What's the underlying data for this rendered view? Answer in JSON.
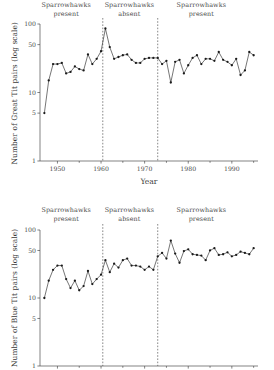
{
  "figure": {
    "background": "#ffffff",
    "ink": "#2b2b2b"
  },
  "chart_data": [
    {
      "type": "line",
      "id": "great-tit",
      "title": "",
      "xlabel": "Year",
      "ylabel": "Number of Great Tit pairs (log scale)",
      "xlim": [
        1946,
        1996
      ],
      "ylim": [
        1,
        100
      ],
      "yscale": "log",
      "grid": false,
      "legend_position": "none",
      "yticks": [
        1,
        5,
        10,
        50,
        100
      ],
      "ytick_labels": [
        "1",
        "5",
        "10",
        "50",
        "100"
      ],
      "xticks": [
        1950,
        1960,
        1970,
        1980,
        1990
      ],
      "xtick_labels": [
        "1950",
        "1960",
        "1970",
        "1980",
        "1990"
      ],
      "xticks_minor": [
        1945,
        1955,
        1965,
        1975,
        1985,
        1995
      ],
      "annotations": [
        {
          "text_line1": "Sparrowhawks",
          "text_line2": "present",
          "x": 1952
        },
        {
          "text_line1": "Sparrowhawks",
          "text_line2": "absent",
          "x": 1966.5
        },
        {
          "text_line1": "Sparrowhawks",
          "text_line2": "present",
          "x": 1983
        }
      ],
      "vlines": [
        1960.4,
        1973.0
      ],
      "x": [
        1947,
        1948,
        1949,
        1950,
        1951,
        1952,
        1953,
        1954,
        1955,
        1956,
        1957,
        1958,
        1959,
        1960,
        1961,
        1962,
        1963,
        1964,
        1965,
        1966,
        1967,
        1968,
        1969,
        1970,
        1971,
        1972,
        1973,
        1974,
        1975,
        1976,
        1977,
        1978,
        1979,
        1980,
        1981,
        1982,
        1983,
        1984,
        1985,
        1986,
        1987,
        1988,
        1989,
        1990,
        1991,
        1992,
        1993,
        1994,
        1995
      ],
      "values": [
        5,
        15,
        26,
        26,
        27,
        19,
        20,
        24,
        22,
        21,
        36,
        26,
        31,
        40,
        86,
        46,
        31,
        33,
        35,
        36,
        30,
        27,
        27,
        31,
        32,
        32,
        32,
        26,
        29,
        14,
        28,
        30,
        19,
        25,
        32,
        35,
        26,
        31,
        31,
        29,
        39,
        30,
        28,
        25,
        31,
        18,
        21,
        39,
        35
      ]
    },
    {
      "type": "line",
      "id": "blue-tit",
      "title": "",
      "xlabel": "",
      "ylabel": "Number of Blue Tit pairs (log scale)",
      "xlim": [
        1946,
        1996
      ],
      "ylim": [
        1,
        100
      ],
      "yscale": "log",
      "grid": false,
      "legend_position": "none",
      "yticks": [
        1,
        5,
        10,
        50,
        100
      ],
      "ytick_labels": [
        "1",
        "5",
        "10",
        "50",
        "100"
      ],
      "xticks": [
        1950,
        1960,
        1970,
        1980,
        1990
      ],
      "xtick_labels": [
        "",
        "",
        "",
        "",
        ""
      ],
      "xticks_minor": [
        1945,
        1955,
        1965,
        1975,
        1985,
        1995
      ],
      "annotations": [
        {
          "text_line1": "Sparrowhawks",
          "text_line2": "present",
          "x": 1952
        },
        {
          "text_line1": "Sparrowhawks",
          "text_line2": "absent",
          "x": 1966.5
        },
        {
          "text_line1": "Sparrowhawks",
          "text_line2": "present",
          "x": 1983
        }
      ],
      "vlines": [
        1960.4,
        1973.0
      ],
      "x": [
        1947,
        1948,
        1949,
        1950,
        1951,
        1952,
        1953,
        1954,
        1955,
        1956,
        1957,
        1958,
        1959,
        1960,
        1961,
        1962,
        1963,
        1964,
        1965,
        1966,
        1967,
        1968,
        1969,
        1970,
        1971,
        1972,
        1973,
        1974,
        1975,
        1976,
        1977,
        1978,
        1979,
        1980,
        1981,
        1982,
        1983,
        1984,
        1985,
        1986,
        1987,
        1988,
        1989,
        1990,
        1991,
        1992,
        1993,
        1994,
        1995
      ],
      "values": [
        10,
        18,
        26,
        30,
        30,
        19,
        14,
        18,
        13,
        15,
        25,
        16,
        19,
        22,
        36,
        24,
        32,
        28,
        36,
        38,
        30,
        30,
        29,
        26,
        29,
        26,
        41,
        46,
        38,
        70,
        45,
        33,
        49,
        52,
        44,
        43,
        42,
        36,
        50,
        54,
        43,
        44,
        47,
        41,
        43,
        48,
        46,
        44,
        54
      ]
    }
  ]
}
